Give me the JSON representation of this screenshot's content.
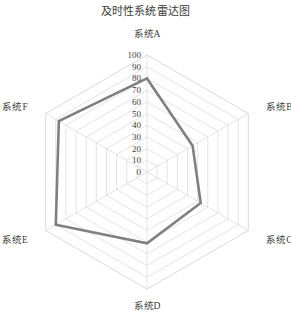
{
  "chart_data": {
    "type": "radar",
    "title": "及时性系统雷达图",
    "categories": [
      "系统A",
      "系统B",
      "系统C",
      "系统D",
      "系统E",
      "系统F"
    ],
    "series": [
      {
        "name": "及时性",
        "values": [
          80,
          45,
          53,
          61,
          90,
          87
        ],
        "line_color": "#808080",
        "line_width": 2.6,
        "fill": "none"
      }
    ],
    "ticks": [
      0,
      10,
      20,
      30,
      40,
      50,
      60,
      70,
      80,
      90,
      100
    ],
    "rlim": [
      0,
      100
    ],
    "grid": true,
    "grid_shape": "polygon",
    "grid_color": "#d9d9d9",
    "legend": "none",
    "xlabel": "",
    "ylabel": ""
  },
  "axis_labels": {
    "a": "系统A",
    "b": "系统B",
    "c": "系统C",
    "d": "系统D",
    "e": "系统E",
    "f": "系统F"
  },
  "tick_labels": {
    "t0": "0",
    "t10": "10",
    "t20": "20",
    "t30": "30",
    "t40": "40",
    "t50": "50",
    "t60": "60",
    "t70": "70",
    "t80": "80",
    "t90": "90",
    "t100": "100"
  }
}
